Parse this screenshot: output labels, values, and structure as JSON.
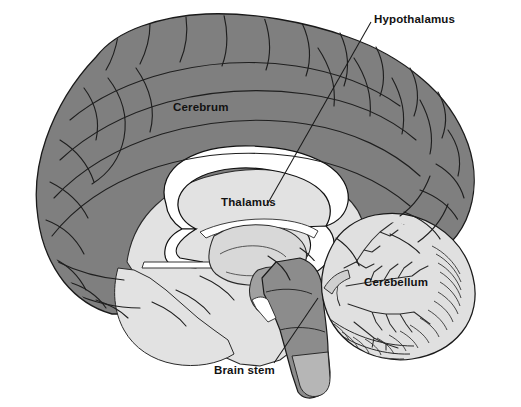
{
  "figure": {
    "name": "brain-sagittal-section",
    "background_color": "#ffffff",
    "width": 521,
    "height": 407
  },
  "palette": {
    "cortex_gray": "#7f7f7f",
    "cortex_gray_dark": "#6e6e6e",
    "inner_light": "#e2e2e2",
    "inner_light_2": "#d8d8d8",
    "cerebellum_fill": "#e0e0e0",
    "brainstem_fill": "#8c8c8c",
    "corpus_callosum_white": "#ffffff",
    "outline": "#1a1a1a",
    "label_text": "#121212",
    "leader_line": "#1a1a1a"
  },
  "labels": [
    {
      "id": "hypothalamus",
      "text": "Hypothalamus",
      "x": 374,
      "y": 14,
      "anchor": "left",
      "has_leader_line": true,
      "leader_from": [
        372,
        22
      ],
      "leader_to": [
        268,
        202
      ]
    },
    {
      "id": "cerebrum",
      "text": "Cerebrum",
      "x": 173,
      "y": 102,
      "anchor": "left",
      "has_leader_line": false,
      "on_region": "cerebral-cortex"
    },
    {
      "id": "thalamus",
      "text": "Thalamus",
      "x": 221,
      "y": 197,
      "anchor": "left",
      "has_leader_line": false,
      "on_region": "thalamus"
    },
    {
      "id": "cerebellum",
      "text": "Cerebellum",
      "x": 364,
      "y": 277,
      "anchor": "left",
      "has_leader_line": false,
      "on_region": "cerebellum"
    },
    {
      "id": "brain-stem",
      "text": "Brain stem",
      "x": 214,
      "y": 365,
      "anchor": "left",
      "has_leader_line": true,
      "leader_from": [
        276,
        364
      ],
      "leader_to": [
        318,
        300
      ]
    }
  ],
  "regions": [
    {
      "id": "cerebral-cortex",
      "label": "Cerebrum",
      "fill": "#7f7f7f"
    },
    {
      "id": "white-matter",
      "label": "White matter",
      "fill": "#e2e2e2"
    },
    {
      "id": "corpus-callosum",
      "label": "Corpus callosum",
      "fill": "#ffffff"
    },
    {
      "id": "thalamus",
      "label": "Thalamus",
      "fill": "#d8d8d8"
    },
    {
      "id": "hypothalamus",
      "label": "Hypothalamus",
      "fill": "#a0a0a0"
    },
    {
      "id": "cerebellum",
      "label": "Cerebellum",
      "fill": "#e0e0e0"
    },
    {
      "id": "brain-stem",
      "label": "Brain stem",
      "fill": "#8c8c8c"
    }
  ]
}
